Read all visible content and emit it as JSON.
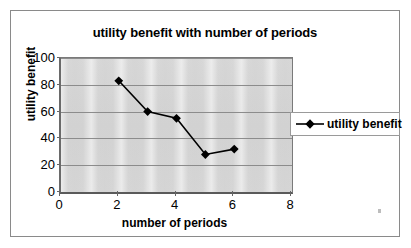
{
  "chart_data": {
    "type": "line",
    "title": "utility benefit with number of periods",
    "xlabel": "number of periods",
    "ylabel": "utility benefit",
    "x": [
      2,
      3,
      4,
      5,
      6
    ],
    "series": [
      {
        "name": "utility benefit",
        "values": [
          83,
          60,
          55,
          28,
          32
        ],
        "marker": "diamond",
        "color": "#000000"
      }
    ],
    "xlim": [
      0,
      8
    ],
    "ylim": [
      0,
      100
    ],
    "xticks": [
      0,
      2,
      4,
      6,
      8
    ],
    "yticks": [
      0,
      20,
      40,
      60,
      80,
      100
    ],
    "xtick_labels": [
      "0",
      "2",
      "4",
      "6",
      "8"
    ],
    "ytick_labels": [
      "0",
      "20",
      "40",
      "60",
      "80",
      "100"
    ],
    "grid": "horizontal",
    "legend_position": "right",
    "plot_background": "#d5d5d5",
    "frame_border": "#8a8a8a"
  },
  "legend": {
    "entries": [
      {
        "label": "utility benefit"
      }
    ]
  }
}
